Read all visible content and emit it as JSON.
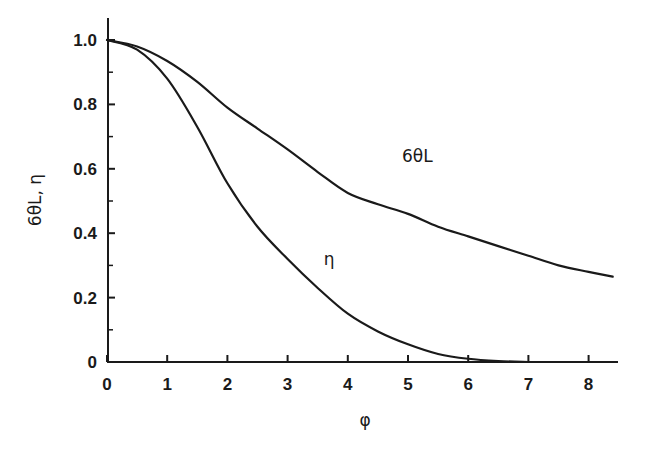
{
  "chart_data": {
    "type": "line",
    "title": "",
    "xlabel": "φ",
    "ylabel": "6θL, η",
    "xlim": [
      0,
      8.5
    ],
    "ylim": [
      0,
      1.0
    ],
    "x_ticks": [
      "0",
      "1",
      "2",
      "3",
      "4",
      "5",
      "6",
      "7",
      "8"
    ],
    "y_ticks": [
      "0",
      "0.2",
      "0.4",
      "0.6",
      "0.8",
      "1.0"
    ],
    "grid": false,
    "legend": "none (inline curve labels)",
    "series": [
      {
        "name": "6θL",
        "label": "6θL",
        "x": [
          0,
          0.5,
          1,
          1.5,
          2,
          2.5,
          3,
          3.5,
          4,
          4.5,
          5,
          5.5,
          6,
          6.5,
          7,
          7.5,
          8,
          8.4
        ],
        "y": [
          1.0,
          0.98,
          0.935,
          0.87,
          0.79,
          0.725,
          0.66,
          0.59,
          0.525,
          0.49,
          0.46,
          0.42,
          0.39,
          0.36,
          0.33,
          0.3,
          0.28,
          0.265
        ]
      },
      {
        "name": "η",
        "label": "η",
        "x": [
          0,
          0.5,
          1,
          1.5,
          2,
          2.5,
          3,
          3.5,
          4,
          4.5,
          5,
          5.5,
          6,
          6.5,
          7
        ],
        "y": [
          1.0,
          0.97,
          0.88,
          0.73,
          0.555,
          0.42,
          0.32,
          0.23,
          0.15,
          0.095,
          0.055,
          0.025,
          0.01,
          0.003,
          0.0
        ]
      }
    ],
    "annotations": [
      {
        "text": "6θL",
        "x": 4.9,
        "y": 0.62
      },
      {
        "text": "η",
        "x": 3.6,
        "y": 0.3
      }
    ]
  }
}
